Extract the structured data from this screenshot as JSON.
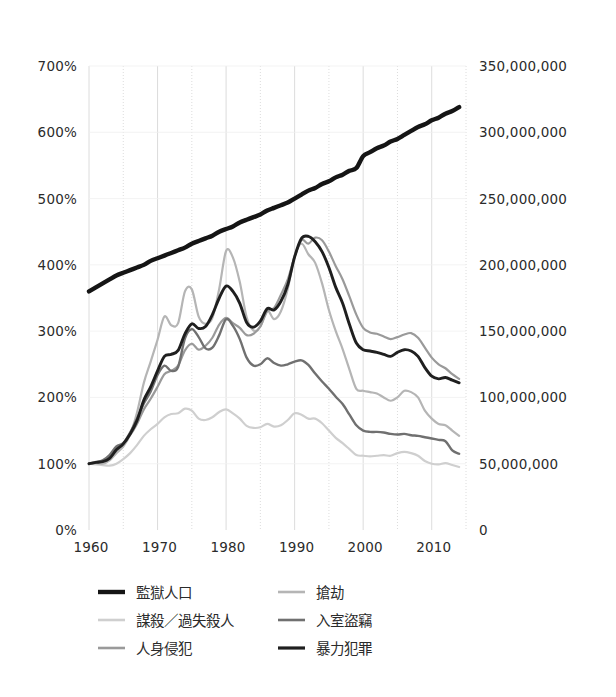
{
  "chart_data": {
    "type": "line",
    "title": "",
    "subtitle": "",
    "xlabel": "",
    "ylabel": "",
    "y2label": "",
    "grid": true,
    "legend_position": "bottom",
    "x": [
      1960,
      1961,
      1962,
      1963,
      1964,
      1965,
      1966,
      1967,
      1968,
      1969,
      1970,
      1971,
      1972,
      1973,
      1974,
      1975,
      1976,
      1977,
      1978,
      1979,
      1980,
      1981,
      1982,
      1983,
      1984,
      1985,
      1986,
      1987,
      1988,
      1989,
      1990,
      1991,
      1992,
      1993,
      1994,
      1995,
      1996,
      1997,
      1998,
      1999,
      2000,
      2001,
      2002,
      2003,
      2004,
      2005,
      2006,
      2007,
      2008,
      2009,
      2010,
      2011,
      2012,
      2013,
      2014
    ],
    "xlim": [
      1960,
      2015
    ],
    "xticks": [
      1960,
      1970,
      1980,
      1990,
      2000,
      2010
    ],
    "xticklabels": [
      "1960",
      "1970",
      "1980",
      "1990",
      "2000",
      "2010"
    ],
    "xminor_step": 5,
    "ylim": [
      0,
      700
    ],
    "yticks": [
      0,
      100,
      200,
      300,
      400,
      500,
      600,
      700
    ],
    "yticklabels": [
      "0%",
      "100%",
      "200%",
      "300%",
      "400%",
      "500%",
      "600%",
      "700%"
    ],
    "y2lim": [
      0,
      350000000
    ],
    "y2ticks": [
      0,
      50000000,
      100000000,
      150000000,
      200000000,
      250000000,
      300000000,
      350000000
    ],
    "y2ticklabels": [
      "0",
      "50,000,000",
      "100,000,000",
      "150,000,000",
      "200,000,000",
      "250,000,000",
      "300,000,000",
      "350,000,000"
    ],
    "series": [
      {
        "name": "監獄人口",
        "axis": "right",
        "color": "#151515",
        "width": 4.4,
        "unit": "people",
        "values": [
          180000000,
          183000000,
          186000000,
          189000000,
          192000000,
          194000000,
          196000000,
          198000000,
          200000000,
          203000000,
          205000000,
          207000000,
          209000000,
          211000000,
          213000000,
          216000000,
          218000000,
          220000000,
          222000000,
          225000000,
          227000000,
          229000000,
          232000000,
          234000000,
          236000000,
          238000000,
          241000000,
          243000000,
          245000000,
          247000000,
          250000000,
          253000000,
          256000000,
          258000000,
          261000000,
          263000000,
          266000000,
          268000000,
          271000000,
          273000000,
          282000000,
          285000000,
          288000000,
          290000000,
          293000000,
          295000000,
          298000000,
          301000000,
          304000000,
          306000000,
          309000000,
          311000000,
          314000000,
          316000000,
          319000000
        ]
      },
      {
        "name": "謀殺／過失殺人",
        "axis": "left",
        "color": "#cfcfcf",
        "width": 2.2,
        "unit": "percent",
        "values": [
          100,
          99,
          98,
          97,
          100,
          107,
          116,
          128,
          142,
          152,
          160,
          170,
          175,
          176,
          183,
          180,
          168,
          166,
          170,
          178,
          182,
          176,
          168,
          157,
          154,
          155,
          160,
          156,
          158,
          166,
          176,
          174,
          168,
          168,
          161,
          150,
          139,
          131,
          122,
          113,
          112,
          111,
          112,
          113,
          112,
          116,
          118,
          116,
          112,
          104,
          100,
          99,
          101,
          98,
          95
        ]
      },
      {
        "name": "人身侵犯",
        "axis": "left",
        "color": "#9a9a9a",
        "width": 2.2,
        "unit": "percent",
        "values": [
          100,
          103,
          104,
          110,
          122,
          131,
          143,
          160,
          182,
          198,
          216,
          235,
          240,
          248,
          271,
          281,
          272,
          278,
          290,
          310,
          320,
          312,
          305,
          294,
          296,
          307,
          330,
          335,
          355,
          378,
          412,
          437,
          432,
          441,
          437,
          420,
          398,
          378,
          352,
          325,
          305,
          298,
          296,
          292,
          288,
          291,
          295,
          297,
          290,
          275,
          260,
          250,
          244,
          235,
          228
        ]
      },
      {
        "name": "搶劫",
        "axis": "left",
        "color": "#b5b5b5",
        "width": 2.2,
        "unit": "percent",
        "values": [
          100,
          101,
          100,
          105,
          116,
          126,
          144,
          177,
          222,
          254,
          287,
          322,
          309,
          312,
          360,
          363,
          322,
          311,
          320,
          364,
          421,
          411,
          374,
          321,
          301,
          307,
          331,
          318,
          330,
          364,
          414,
          432,
          416,
          403,
          372,
          332,
          300,
          273,
          242,
          213,
          210,
          208,
          206,
          200,
          195,
          200,
          210,
          208,
          200,
          180,
          168,
          160,
          158,
          150,
          142
        ]
      },
      {
        "name": "入室盜竊",
        "axis": "left",
        "color": "#707070",
        "width": 2.4,
        "unit": "percent",
        "values": [
          100,
          102,
          105,
          113,
          126,
          131,
          147,
          168,
          191,
          209,
          234,
          248,
          240,
          246,
          289,
          303,
          291,
          274,
          275,
          294,
          318,
          308,
          288,
          260,
          248,
          250,
          259,
          252,
          248,
          250,
          254,
          256,
          249,
          236,
          224,
          213,
          201,
          190,
          174,
          158,
          150,
          148,
          148,
          147,
          145,
          144,
          145,
          143,
          142,
          140,
          138,
          136,
          134,
          120,
          115
        ]
      },
      {
        "name": "暴力犯罪",
        "axis": "left",
        "color": "#1f1f1f",
        "width": 2.9,
        "unit": "percent",
        "values": [
          100,
          102,
          103,
          108,
          121,
          130,
          145,
          165,
          196,
          216,
          240,
          262,
          265,
          271,
          296,
          311,
          304,
          307,
          325,
          350,
          368,
          360,
          342,
          313,
          306,
          315,
          334,
          332,
          345,
          370,
          412,
          440,
          443,
          435,
          420,
          396,
          366,
          342,
          310,
          282,
          272,
          270,
          268,
          265,
          262,
          268,
          272,
          270,
          262,
          245,
          232,
          228,
          230,
          226,
          222
        ]
      }
    ],
    "legend": [
      {
        "label": "監獄人口",
        "color": "#151515",
        "width": 4.4,
        "column": 0,
        "row": 0
      },
      {
        "label": "謀殺／過失殺人",
        "color": "#cfcfcf",
        "width": 2.6,
        "column": 0,
        "row": 1
      },
      {
        "label": "人身侵犯",
        "color": "#9a9a9a",
        "width": 2.6,
        "column": 0,
        "row": 2
      },
      {
        "label": "搶劫",
        "color": "#b5b5b5",
        "width": 2.6,
        "column": 1,
        "row": 0
      },
      {
        "label": "入室盜竊",
        "color": "#707070",
        "width": 2.6,
        "column": 1,
        "row": 1
      },
      {
        "label": "暴力犯罪",
        "color": "#1f1f1f",
        "width": 3.2,
        "column": 1,
        "row": 2
      }
    ]
  },
  "style": {
    "background": "#ffffff",
    "gridline_color": "#d8d8d8",
    "text_color": "#2b2b2b"
  }
}
